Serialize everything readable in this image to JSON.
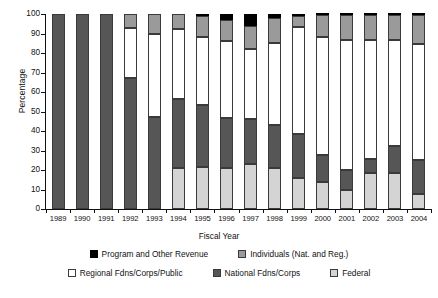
{
  "chart_data": {
    "type": "bar",
    "stacked": true,
    "title": "",
    "xlabel": "Fiscal Year",
    "ylabel": "Percentage",
    "ylim": [
      0,
      100
    ],
    "yticks": [
      0,
      10,
      20,
      30,
      40,
      50,
      60,
      70,
      80,
      90,
      100
    ],
    "grid": false,
    "legend_position": "bottom",
    "categories": [
      "1989",
      "1990",
      "1991",
      "1992",
      "1993",
      "1994",
      "1995",
      "1996",
      "1997",
      "1998",
      "1999",
      "2000",
      "2001",
      "2002",
      "2003",
      "2004"
    ],
    "series": [
      {
        "name": "Federal",
        "color": "#d4d4d4",
        "values": [
          0,
          0,
          0,
          0,
          0,
          21,
          21.5,
          21,
          23,
          21,
          16,
          14,
          9.5,
          18.5,
          18.5,
          7.5
        ]
      },
      {
        "name": "National Fdns/Corps",
        "color": "#565656",
        "values": [
          100,
          100,
          100,
          67,
          47,
          35.5,
          32,
          25.5,
          23,
          22,
          22.5,
          13.5,
          10.5,
          7,
          14,
          17.5
        ]
      },
      {
        "name": "Regional Fdns/Corps/Public",
        "color": "#ffffff",
        "values": [
          0,
          0,
          0,
          26,
          43,
          36,
          34.5,
          39.5,
          36,
          42,
          55,
          60.5,
          66.5,
          61,
          54,
          59.5
        ]
      },
      {
        "name": "Individuals (Nat. and Reg.)",
        "color": "#9a9a9a",
        "values": [
          0,
          0,
          0,
          7,
          10,
          7.5,
          11,
          11,
          12,
          13,
          5.5,
          11.5,
          13,
          13,
          13,
          15
        ]
      },
      {
        "name": "Program and Other Revenue",
        "color": "#000000",
        "values": [
          0,
          0,
          0,
          0,
          0,
          0,
          1,
          3,
          6,
          2,
          1,
          0.5,
          0.5,
          0.5,
          0.5,
          0.5
        ]
      }
    ],
    "cumulative_tops": {
      "note": "stack order bottom-to-top: Federal, National Fdns/Corps, Regional Fdns/Corps/Public, Individuals (Nat. and Reg.), Program and Other Revenue",
      "1989": [
        0,
        100,
        100,
        100,
        100
      ],
      "1990": [
        0,
        100,
        100,
        100,
        100
      ],
      "1991": [
        0,
        100,
        100,
        100,
        100
      ],
      "1992": [
        0,
        67,
        93,
        100,
        100
      ],
      "1993": [
        0,
        47,
        90,
        100,
        100
      ],
      "1994": [
        21,
        56.5,
        92.5,
        100,
        100
      ],
      "1995": [
        21.5,
        53.5,
        88,
        99,
        100
      ],
      "1996": [
        21,
        46.5,
        86,
        97,
        100
      ],
      "1997": [
        23,
        46,
        82,
        94,
        100
      ],
      "1998": [
        21,
        43,
        85,
        98,
        100
      ],
      "1999": [
        16,
        38.5,
        93.5,
        99,
        100
      ],
      "2000": [
        14,
        27.5,
        88,
        99.5,
        100
      ],
      "2001": [
        9.5,
        20,
        86.5,
        99.5,
        100
      ],
      "2002": [
        18.5,
        25.5,
        86.5,
        99.5,
        100
      ],
      "2003": [
        18.5,
        32.5,
        86.5,
        99.5,
        100
      ],
      "2004": [
        7.5,
        25,
        84.5,
        99.5,
        100
      ]
    }
  },
  "axes": {
    "ylabel": "Percentage",
    "xlabel": "Fiscal Year",
    "yticks": [
      "0",
      "10",
      "20",
      "30",
      "40",
      "50",
      "60",
      "70",
      "80",
      "90",
      "100"
    ],
    "xticks": [
      "1989",
      "1990",
      "1991",
      "1992",
      "1993",
      "1994",
      "1995",
      "1996",
      "1997",
      "1998",
      "1999",
      "2000",
      "2001",
      "2002",
      "2003",
      "2004"
    ]
  },
  "legend": {
    "row1": [
      {
        "label": "Program and Other Revenue",
        "swatch": "black-swatch",
        "color": "#000000"
      },
      {
        "label": "Individuals (Nat. and Reg.)",
        "swatch": "gray-swatch",
        "color": "#9a9a9a"
      }
    ],
    "row2": [
      {
        "label": "Regional Fdns/Corps/Public",
        "swatch": "white-swatch",
        "color": "#ffffff"
      },
      {
        "label": "National Fdns/Corps",
        "swatch": "dark-gray-swatch",
        "color": "#565656"
      },
      {
        "label": "Federal",
        "swatch": "light-gray-swatch",
        "color": "#d4d4d4"
      }
    ]
  }
}
